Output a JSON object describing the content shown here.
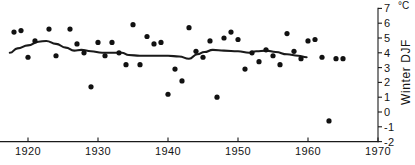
{
  "chart_data": {
    "type": "scatter",
    "title": "",
    "subtitle": "",
    "xlabel": "",
    "ylabel": "Winter DJF",
    "unit": "°C",
    "xlim": [
      1917,
      1970
    ],
    "ylim": [
      -2,
      7
    ],
    "grid": false,
    "legend": null,
    "axis_position": {
      "y_axis": "right",
      "x_axis": "bottom"
    },
    "xticks": [
      1920,
      1930,
      1940,
      1950,
      1960,
      1970
    ],
    "xtick_labels": [
      "1920",
      "1930",
      "1940",
      "1950",
      "1960",
      "1970"
    ],
    "yticks": [
      -2,
      -1,
      0,
      1,
      2,
      3,
      4,
      5,
      6,
      7
    ],
    "ytick_labels": [
      "-2",
      "-1",
      "0",
      "1",
      "2",
      "3",
      "4",
      "5",
      "6",
      "7"
    ],
    "series": [
      {
        "name": "Winter DJF temperature",
        "type": "scatter",
        "marker": "filled-circle",
        "color": "#111111",
        "points": [
          {
            "x": 1918,
            "y": 5.4
          },
          {
            "x": 1919,
            "y": 5.5
          },
          {
            "x": 1920,
            "y": 3.7
          },
          {
            "x": 1921,
            "y": 4.8
          },
          {
            "x": 1923,
            "y": 5.6
          },
          {
            "x": 1924,
            "y": 3.8
          },
          {
            "x": 1926,
            "y": 5.6
          },
          {
            "x": 1927,
            "y": 4.6
          },
          {
            "x": 1928,
            "y": 4.0
          },
          {
            "x": 1929,
            "y": 1.7
          },
          {
            "x": 1930,
            "y": 4.7
          },
          {
            "x": 1931,
            "y": 3.8
          },
          {
            "x": 1932,
            "y": 4.7
          },
          {
            "x": 1933,
            "y": 4.0
          },
          {
            "x": 1934,
            "y": 3.2
          },
          {
            "x": 1935,
            "y": 5.9
          },
          {
            "x": 1936,
            "y": 3.2
          },
          {
            "x": 1937,
            "y": 5.1
          },
          {
            "x": 1938,
            "y": 4.6
          },
          {
            "x": 1939,
            "y": 4.7
          },
          {
            "x": 1940,
            "y": 1.2
          },
          {
            "x": 1941,
            "y": 2.9
          },
          {
            "x": 1942,
            "y": 2.1
          },
          {
            "x": 1943,
            "y": 5.7
          },
          {
            "x": 1944,
            "y": 4.1
          },
          {
            "x": 1945,
            "y": 3.7
          },
          {
            "x": 1946,
            "y": 4.8
          },
          {
            "x": 1947,
            "y": 1.0
          },
          {
            "x": 1948,
            "y": 5.0
          },
          {
            "x": 1949,
            "y": 5.4
          },
          {
            "x": 1950,
            "y": 4.9
          },
          {
            "x": 1951,
            "y": 2.9
          },
          {
            "x": 1952,
            "y": 4.0
          },
          {
            "x": 1953,
            "y": 3.4
          },
          {
            "x": 1954,
            "y": 4.2
          },
          {
            "x": 1955,
            "y": 3.8
          },
          {
            "x": 1956,
            "y": 3.2
          },
          {
            "x": 1957,
            "y": 5.3
          },
          {
            "x": 1958,
            "y": 4.1
          },
          {
            "x": 1959,
            "y": 3.6
          },
          {
            "x": 1960,
            "y": 4.8
          },
          {
            "x": 1961,
            "y": 4.9
          },
          {
            "x": 1962,
            "y": 3.7
          },
          {
            "x": 1963,
            "y": -0.6
          },
          {
            "x": 1964,
            "y": 3.6
          },
          {
            "x": 1965,
            "y": 3.6
          }
        ]
      },
      {
        "name": "Smoothed trend",
        "type": "line",
        "color": "#1a1a1a",
        "points": [
          {
            "x": 1917.4,
            "y": 4.0
          },
          {
            "x": 1918.5,
            "y": 4.3
          },
          {
            "x": 1920.0,
            "y": 4.5
          },
          {
            "x": 1921.5,
            "y": 4.75
          },
          {
            "x": 1922.6,
            "y": 4.8
          },
          {
            "x": 1924.0,
            "y": 4.6
          },
          {
            "x": 1925.4,
            "y": 4.35
          },
          {
            "x": 1926.6,
            "y": 4.15
          },
          {
            "x": 1927.6,
            "y": 4.2
          },
          {
            "x": 1929.0,
            "y": 4.1
          },
          {
            "x": 1930.6,
            "y": 4.0
          },
          {
            "x": 1932.0,
            "y": 4.0
          },
          {
            "x": 1933.4,
            "y": 4.0
          },
          {
            "x": 1934.4,
            "y": 3.85
          },
          {
            "x": 1936.0,
            "y": 3.8
          },
          {
            "x": 1938.0,
            "y": 3.8
          },
          {
            "x": 1940.0,
            "y": 3.8
          },
          {
            "x": 1941.6,
            "y": 3.75
          },
          {
            "x": 1943.0,
            "y": 3.6
          },
          {
            "x": 1944.2,
            "y": 3.9
          },
          {
            "x": 1945.2,
            "y": 4.05
          },
          {
            "x": 1946.4,
            "y": 4.2
          },
          {
            "x": 1948.0,
            "y": 4.15
          },
          {
            "x": 1950.0,
            "y": 4.1
          },
          {
            "x": 1951.6,
            "y": 4.0
          },
          {
            "x": 1952.6,
            "y": 4.1
          },
          {
            "x": 1954.0,
            "y": 4.15
          },
          {
            "x": 1955.4,
            "y": 4.05
          },
          {
            "x": 1957.0,
            "y": 3.9
          },
          {
            "x": 1958.6,
            "y": 3.8
          },
          {
            "x": 1959.8,
            "y": 3.7
          }
        ]
      }
    ]
  }
}
